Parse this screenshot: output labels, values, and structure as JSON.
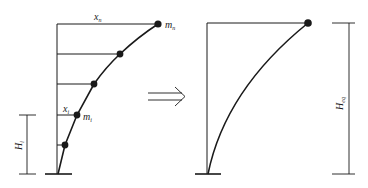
{
  "left_diagram": {
    "top_displacement_label": "x",
    "top_displacement_sub": "n",
    "top_mass_label": "m",
    "top_mass_sub": "n",
    "story_displacement_label": "x",
    "story_displacement_sub": "i",
    "story_mass_label": "m",
    "story_mass_sub": "i",
    "height_label": "H",
    "height_sub": "i"
  },
  "arrow": {
    "type": "double-arrow-right"
  },
  "right_diagram": {
    "height_label": "H",
    "height_sub": "eq"
  },
  "colors": {
    "line": "#1a1a1a",
    "background": "#ffffff"
  }
}
